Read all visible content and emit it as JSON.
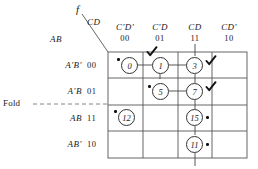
{
  "figure": {
    "function_label": "f",
    "col_group_label": "CD",
    "row_group_label": "AB",
    "fold_label": "Fold"
  },
  "columns": [
    {
      "name": "C'D'",
      "bits": "00"
    },
    {
      "name": "C'D",
      "bits": "01"
    },
    {
      "name": "CD",
      "bits": "11"
    },
    {
      "name": "CD'",
      "bits": "10"
    }
  ],
  "rows": [
    {
      "name": "A'B'",
      "bits": "00"
    },
    {
      "name": "A'B",
      "bits": "01"
    },
    {
      "name": "AB",
      "bits": "11"
    },
    {
      "name": "AB'",
      "bits": "10"
    }
  ],
  "cells": [
    {
      "minterm": "0",
      "row": 0,
      "col": 0,
      "dot": "left",
      "check": false
    },
    {
      "minterm": "1",
      "row": 0,
      "col": 1,
      "dot": "none",
      "check": true
    },
    {
      "minterm": "3",
      "row": 0,
      "col": 2,
      "dot": "none",
      "check": true
    },
    {
      "minterm": "5",
      "row": 1,
      "col": 1,
      "dot": "left",
      "check": false
    },
    {
      "minterm": "7",
      "row": 1,
      "col": 2,
      "dot": "none",
      "check": true
    },
    {
      "minterm": "12",
      "row": 2,
      "col": 0,
      "dot": "left",
      "check": false
    },
    {
      "minterm": "15",
      "row": 2,
      "col": 2,
      "dot": "right",
      "check": false
    },
    {
      "minterm": "11",
      "row": 3,
      "col": 2,
      "dot": "right",
      "check": false
    }
  ],
  "colors": {
    "grid_line": "#555555",
    "ink": "#1a1a1a",
    "dot": "#111111",
    "fold_line": "#777777"
  }
}
